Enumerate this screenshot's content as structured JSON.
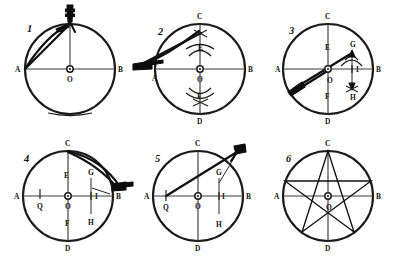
{
  "figure": {
    "panel_count": 6,
    "ink_color": "#111111",
    "paper_color": "#ffffff",
    "rows": 2,
    "columns": 3
  },
  "panels": [
    {
      "number": "1",
      "caption": "Draw circle with centre O and horizontal diameter AB; compass set at top of circle",
      "labels": [
        {
          "text": "A",
          "role": "point-left-end-of-diameter"
        },
        {
          "text": "B",
          "role": "point-right-end-of-diameter"
        },
        {
          "text": "O",
          "role": "circle-centre"
        }
      ],
      "tool": "compass",
      "tool_position": "top-of-circle",
      "features": [
        "circle",
        "horizontal-diameter",
        "chord-from-A-to-top",
        "vertical-radius"
      ]
    },
    {
      "number": "2",
      "caption": "With compass at A strike arcs crossing above and below, giving E and F; draw vertical diameter CD",
      "labels": [
        {
          "text": "C",
          "role": "point-top-of-circle"
        },
        {
          "text": "E",
          "role": "arc-intersection-upper"
        },
        {
          "text": "A",
          "role": "point-left-end-of-diameter"
        },
        {
          "text": "O",
          "role": "circle-centre"
        },
        {
          "text": "B",
          "role": "point-right-end-of-diameter"
        },
        {
          "text": "F",
          "role": "arc-intersection-lower"
        },
        {
          "text": "D",
          "role": "point-bottom-of-circle"
        }
      ],
      "tool": "compass",
      "tool_position": "left-at-A",
      "features": [
        "circle",
        "horizontal-diameter",
        "vertical-diameter",
        "crossing-arcs-at-E",
        "crossing-arcs-at-F"
      ]
    },
    {
      "number": "3",
      "caption": "Bisect radius OB to locate G, I and H on the right-hand side",
      "labels": [
        {
          "text": "C",
          "role": "point-top-of-circle"
        },
        {
          "text": "E",
          "role": "upper-marked-point"
        },
        {
          "text": "G",
          "role": "upper-right-arc-point"
        },
        {
          "text": "A",
          "role": "point-left-end-of-diameter"
        },
        {
          "text": "I",
          "role": "midpoint-of-radius-OB"
        },
        {
          "text": "B",
          "role": "point-right-end-of-diameter"
        },
        {
          "text": "O",
          "role": "circle-centre"
        },
        {
          "text": "F",
          "role": "lower-marked-point"
        },
        {
          "text": "H",
          "role": "lower-right-arc-point"
        },
        {
          "text": "D",
          "role": "point-bottom-of-circle"
        }
      ],
      "tool": "compass",
      "tool_position": "lower-left-pointing-to-O",
      "features": [
        "circle",
        "both-diameters",
        "ray-to-G",
        "vertical-GH-segment",
        "double-arrow-G-to-H"
      ]
    },
    {
      "number": "4",
      "caption": "Swing an arc from C through the radius to mark Q on diameter AO",
      "labels": [
        {
          "text": "C",
          "role": "point-top-of-circle"
        },
        {
          "text": "E",
          "role": "upper-marked-point"
        },
        {
          "text": "G",
          "role": "upper-right-point"
        },
        {
          "text": "A",
          "role": "point-left-end-of-diameter"
        },
        {
          "text": "Q",
          "role": "point-marked-on-left-radius"
        },
        {
          "text": "O",
          "role": "circle-centre"
        },
        {
          "text": "I",
          "role": "midpoint-of-radius-OB"
        },
        {
          "text": "B",
          "role": "point-right-end-of-diameter"
        },
        {
          "text": "H",
          "role": "lower-right-point"
        },
        {
          "text": "F",
          "role": "lower-marked-point"
        },
        {
          "text": "D",
          "role": "point-bottom-of-circle"
        }
      ],
      "tool": "compass",
      "tool_position": "right-outside-near-B",
      "features": [
        "circle",
        "both-diameters",
        "arc-from-C-to-B",
        "tick-at-Q",
        "vertical-GH-segment"
      ]
    },
    {
      "number": "5",
      "caption": "From Q strike an arc up to the circumference to step off the pentagon side",
      "labels": [
        {
          "text": "C",
          "role": "point-top-of-circle"
        },
        {
          "text": "G",
          "role": "upper-right-point"
        },
        {
          "text": "A",
          "role": "point-left-end-of-diameter"
        },
        {
          "text": "Q",
          "role": "point-marked-on-left-radius"
        },
        {
          "text": "O",
          "role": "circle-centre"
        },
        {
          "text": "I",
          "role": "midpoint-of-radius-OB"
        },
        {
          "text": "B",
          "role": "point-right-end-of-diameter"
        },
        {
          "text": "H",
          "role": "lower-right-point"
        },
        {
          "text": "D",
          "role": "point-bottom-of-circle"
        }
      ],
      "tool": "compass",
      "tool_position": "upper-right-outside-circle",
      "features": [
        "circle",
        "both-diameters",
        "long-ray-from-Q-to-upper-right",
        "vertical-GH-segment"
      ]
    },
    {
      "number": "6",
      "caption": "Join the five division points to complete the pentagram",
      "labels": [
        {
          "text": "C",
          "role": "point-top-of-circle"
        },
        {
          "text": "A",
          "role": "point-left-end-of-diameter"
        },
        {
          "text": "O",
          "role": "circle-centre"
        },
        {
          "text": "B",
          "role": "point-right-end-of-diameter"
        },
        {
          "text": "D",
          "role": "point-bottom-of-circle"
        }
      ],
      "tool": "none",
      "tool_position": "",
      "features": [
        "circle",
        "both-diameters",
        "inscribed-pentagram",
        "five-vertices"
      ]
    }
  ]
}
